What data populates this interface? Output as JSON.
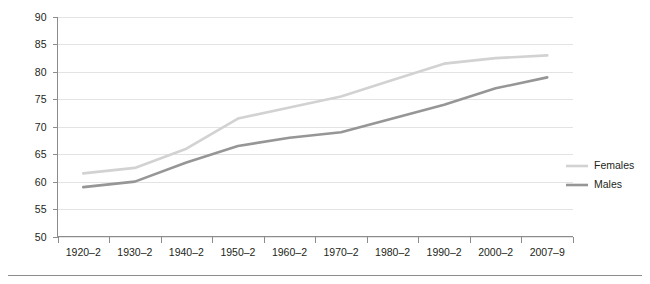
{
  "chart_data": {
    "type": "line",
    "title": "",
    "xlabel": "",
    "ylabel": "",
    "ylim": [
      50,
      90
    ],
    "ytick_step": 5,
    "yticks": [
      90,
      85,
      80,
      75,
      70,
      65,
      60,
      55,
      50
    ],
    "grid": true,
    "legend_position": "right",
    "categories": [
      "1920–2",
      "1930–2",
      "1940–2",
      "1950–2",
      "1960–2",
      "1970–2",
      "1980–2",
      "1990–2",
      "2000–2",
      "2007–9"
    ],
    "series": [
      {
        "name": "Females",
        "color": "#d2d2d2",
        "values": [
          61.5,
          62.5,
          66.0,
          71.5,
          73.5,
          75.5,
          78.5,
          81.5,
          82.5,
          83.0
        ]
      },
      {
        "name": "Males",
        "color": "#969696",
        "values": [
          59.0,
          60.0,
          63.5,
          66.5,
          68.0,
          69.0,
          71.5,
          74.0,
          77.0,
          79.0
        ]
      }
    ]
  },
  "legend": {
    "items": [
      {
        "label": "Females"
      },
      {
        "label": "Males"
      }
    ]
  },
  "colors": {
    "females": "#d2d2d2",
    "males": "#969696",
    "gridline": "#e3e3e3",
    "axis": "#8c8c8c",
    "text": "#231f20",
    "background": "#ffffff"
  }
}
